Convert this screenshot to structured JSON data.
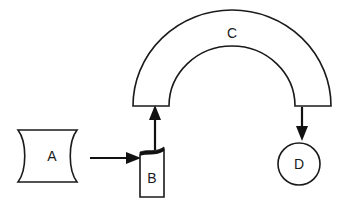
{
  "diagram": {
    "title": "",
    "background_color": "#ffffff",
    "stroke_color": "#1a1a1a",
    "fill_color": "#ffffff",
    "accent_fill_color": "#111111",
    "nodes": [
      {
        "id": "A",
        "label": "A",
        "shape": "curved-tape",
        "x": 52,
        "y": 156
      },
      {
        "id": "B",
        "label": "B",
        "shape": "curled-card",
        "x": 152,
        "y": 178
      },
      {
        "id": "C",
        "label": "C",
        "shape": "semicircular-arc",
        "x": 232,
        "y": 33
      },
      {
        "id": "D",
        "label": "D",
        "shape": "circle",
        "x": 299,
        "y": 164
      }
    ],
    "connectors": [
      {
        "id": "a-to-b",
        "from": "A",
        "to": "B",
        "direction": "right"
      },
      {
        "id": "b-to-c",
        "from": "B",
        "to": "C",
        "direction": "up"
      },
      {
        "id": "c-to-d",
        "from": "C",
        "to": "D",
        "direction": "down"
      }
    ]
  }
}
